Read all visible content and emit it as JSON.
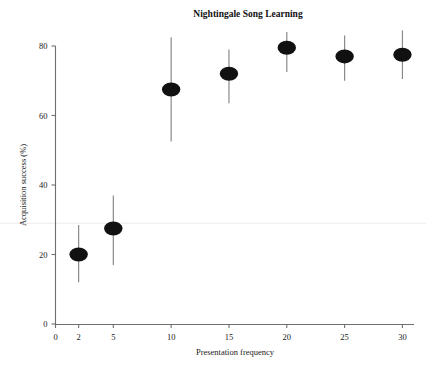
{
  "chart_data": {
    "type": "scatter",
    "title": "Nightingale Song Learning",
    "xlabel": "Presentation frequency",
    "ylabel": "Acquisition success (%)",
    "x": [
      2,
      5,
      10,
      15,
      20,
      25,
      30
    ],
    "values": [
      20,
      27.5,
      67.5,
      72,
      79.5,
      77,
      77.5
    ],
    "error_low": [
      12,
      17,
      52.5,
      63.5,
      72.5,
      70,
      70.5
    ],
    "error_high": [
      28.5,
      37,
      82.5,
      79,
      84,
      83,
      84.5
    ],
    "xlim": [
      0,
      31
    ],
    "ylim": [
      0,
      84
    ],
    "xticks": [
      0,
      2,
      5,
      10,
      15,
      20,
      25,
      30
    ],
    "xtick_labels": [
      "0",
      "2",
      "5",
      "10",
      "15",
      "20",
      "25",
      "30"
    ],
    "yticks": [
      0,
      20,
      40,
      60,
      80
    ],
    "ytick_labels": [
      "0",
      "20",
      "40",
      "60",
      "80"
    ],
    "grid": false,
    "legend": "none",
    "reference_line_y": 29,
    "marker_style": "hatched-ellipse",
    "marker_color": "#111111",
    "error_bar_color": "#8a8a8a",
    "axis_color": "#6f6f6f"
  },
  "axes": {
    "x_title": "Presentation frequency",
    "y_title": "Acquisition success (%)"
  },
  "header": {
    "title": "Nightingale Song Learning"
  }
}
